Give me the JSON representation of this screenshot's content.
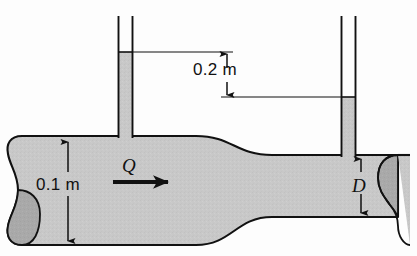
{
  "figure": {
    "type": "engineering-diagram",
    "background_color": "#fdfdfd",
    "fluid_fill_color": "#c8c8c8",
    "fluid_fill_dark_color": "#a8a8a8",
    "outline_color": "#111111"
  },
  "labels": {
    "head_difference": "0.2 m",
    "inlet_diameter": "0.1 m",
    "flow_rate": "Q",
    "outlet_diameter": "D"
  },
  "geometry": {
    "wide_pipe": {
      "top_y": 136,
      "bottom_y": 245,
      "left_x": 8,
      "diameter_label": "0.1 m"
    },
    "narrow_pipe": {
      "top_y": 155,
      "bottom_y": 217,
      "right_x": 410,
      "diameter_label": "D"
    },
    "left_tube": {
      "x_left": 118,
      "x_right": 133,
      "top_y": 16,
      "fluid_level_y": 52
    },
    "right_tube": {
      "x_left": 341,
      "x_right": 356,
      "top_y": 16,
      "fluid_level_y": 97
    },
    "dimension_02m": {
      "arrow_x": 227,
      "top_y": 52,
      "bottom_y": 97
    },
    "dimension_01m": {
      "arrow_x": 68,
      "top_y": 140,
      "bottom_y": 243
    },
    "dimension_d": {
      "arrow_x": 361,
      "top_y": 157,
      "bottom_y": 215
    },
    "flow_arrow": {
      "x_start": 113,
      "x_end": 175,
      "y": 182
    }
  }
}
